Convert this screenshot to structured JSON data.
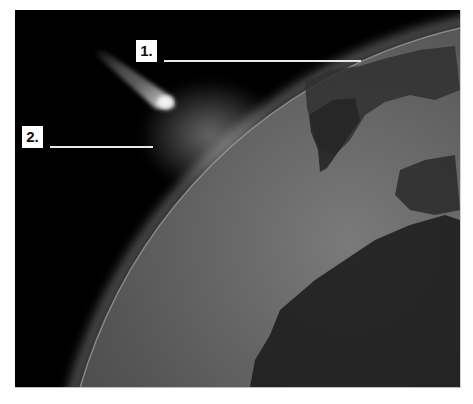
{
  "diagram": {
    "colors": {
      "space": "#000000",
      "earth_light": "#6e6e6e",
      "earth_dark": "#1a1a1a",
      "continent": "#2c2c2c",
      "atmosphere_glow": "#9a9a9a",
      "meteor": "#d8d8d8",
      "label_bg": "#ffffff",
      "leader_line": "#e8e8e8"
    },
    "labels": [
      {
        "text": "1.",
        "answer_blank": ""
      },
      {
        "text": "2.",
        "answer_blank": ""
      }
    ],
    "objects": [
      "meteor",
      "earth",
      "atmosphere"
    ]
  }
}
